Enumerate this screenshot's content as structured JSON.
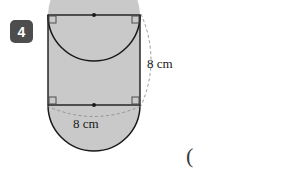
{
  "question": {
    "number": "4"
  },
  "figure": {
    "name": "square-with-two-semicircles-removed",
    "shape": "square",
    "side_length_label_right": "8 cm",
    "side_length_label_bottom": "8 cm",
    "colors": {
      "shaded_region": "#c9c9c9",
      "outline": "#1a1a1a",
      "dashed_arc": "#8c8c8c",
      "badge_background": "#4d4d4d",
      "badge_text": "#ffffff"
    },
    "markers": {
      "right_angle_corners": 4,
      "midpoint_dots": 2
    }
  },
  "answer_area": {
    "open_paren": "("
  }
}
